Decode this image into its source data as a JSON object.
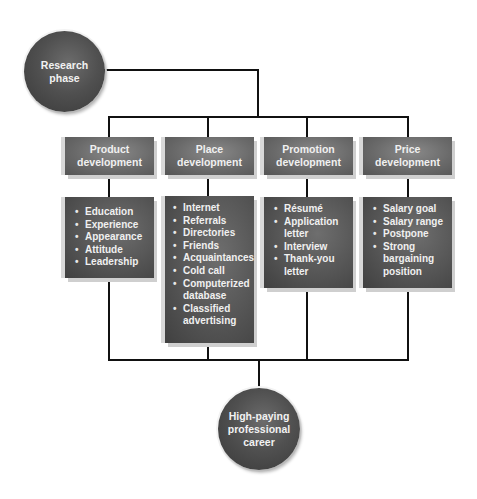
{
  "start": {
    "lines": [
      "Research",
      "phase"
    ]
  },
  "end": {
    "lines": [
      "High-paying",
      "professional",
      "career"
    ]
  },
  "columns": [
    {
      "title": [
        "Product",
        "development"
      ],
      "items": [
        "Education",
        "Experience",
        "Appearance",
        "Attitude",
        "Leadership"
      ]
    },
    {
      "title": [
        "Place",
        "development"
      ],
      "items": [
        "Internet",
        "Referrals",
        "Directories",
        "Friends",
        "Acquaintances",
        "Cold call",
        "Computerized database",
        "Classified advertising"
      ]
    },
    {
      "title": [
        "Promotion",
        "development"
      ],
      "items": [
        "Résumé",
        "Application letter",
        "Interview",
        "Thank-you letter"
      ]
    },
    {
      "title": [
        "Price",
        "development"
      ],
      "items": [
        "Salary goal",
        "Salary range",
        "Postpone",
        "Strong bargaining position"
      ]
    }
  ],
  "colors": {
    "node": "#555555",
    "line": "#111111",
    "text": "#f0f0f0"
  }
}
